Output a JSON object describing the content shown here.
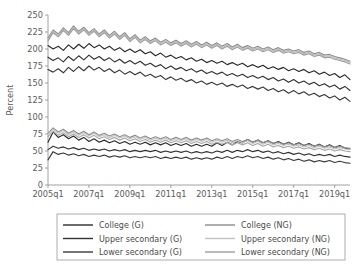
{
  "chart_data": {
    "type": "line",
    "title": "",
    "xlabel": "",
    "ylabel": "Percent",
    "ylim": [
      0,
      250
    ],
    "yticks": [
      0,
      25,
      50,
      75,
      100,
      125,
      150,
      175,
      200,
      225,
      250
    ],
    "ytick_labels": [
      "0",
      "25",
      "50",
      "75",
      "100",
      "125",
      "150",
      "175",
      "200",
      "225",
      "250"
    ],
    "xtick_labels": [
      "2005q1",
      "2007q1",
      "2009q1",
      "2011q1",
      "2013q1",
      "2015q1",
      "2017q1",
      "2019q1"
    ],
    "xtick_values": [
      2005.0,
      2007.0,
      2009.0,
      2011.0,
      2013.0,
      2015.0,
      2017.0,
      2019.0
    ],
    "xlim": [
      2005.0,
      2019.75
    ],
    "grid": false,
    "legend_position": "bottom",
    "x": [
      2005.0,
      2005.25,
      2005.5,
      2005.75,
      2006.0,
      2006.25,
      2006.5,
      2006.75,
      2007.0,
      2007.25,
      2007.5,
      2007.75,
      2008.0,
      2008.25,
      2008.5,
      2008.75,
      2009.0,
      2009.25,
      2009.5,
      2009.75,
      2010.0,
      2010.25,
      2010.5,
      2010.75,
      2011.0,
      2011.25,
      2011.5,
      2011.75,
      2012.0,
      2012.25,
      2012.5,
      2012.75,
      2013.0,
      2013.25,
      2013.5,
      2013.75,
      2014.0,
      2014.25,
      2014.5,
      2014.75,
      2015.0,
      2015.25,
      2015.5,
      2015.75,
      2016.0,
      2016.25,
      2016.5,
      2016.75,
      2017.0,
      2017.25,
      2017.5,
      2017.75,
      2018.0,
      2018.25,
      2018.5,
      2018.75,
      2019.0,
      2019.25,
      2019.5,
      2019.75
    ],
    "series": [
      {
        "name": "College (G)",
        "group": "G",
        "color": "#2b2b2b",
        "width": 1.15,
        "values": [
          205,
          200,
          204,
          198,
          206,
          200,
          207,
          201,
          208,
          202,
          206,
          200,
          204,
          198,
          202,
          196,
          200,
          195,
          199,
          193,
          196,
          190,
          194,
          188,
          191,
          186,
          189,
          184,
          187,
          182,
          185,
          180,
          183,
          179,
          182,
          177,
          180,
          176,
          179,
          174,
          177,
          173,
          176,
          171,
          174,
          170,
          173,
          168,
          171,
          167,
          170,
          165,
          168,
          163,
          166,
          161,
          164,
          158,
          162,
          155
        ]
      },
      {
        "name": "Upper secondary (G)",
        "group": "G",
        "color": "#333333",
        "width": 1.15,
        "values": [
          188,
          183,
          187,
          181,
          189,
          183,
          190,
          184,
          191,
          185,
          189,
          183,
          187,
          181,
          185,
          179,
          183,
          178,
          182,
          176,
          179,
          174,
          177,
          171,
          175,
          170,
          173,
          168,
          171,
          166,
          169,
          164,
          167,
          163,
          166,
          161,
          164,
          160,
          163,
          158,
          161,
          157,
          160,
          155,
          158,
          153,
          156,
          151,
          155,
          150,
          153,
          148,
          151,
          146,
          149,
          144,
          147,
          141,
          145,
          139
        ]
      },
      {
        "name": "Lower secondary (G)",
        "group": "G",
        "color": "#3a3a3a",
        "width": 1.15,
        "values": [
          170,
          166,
          171,
          165,
          173,
          167,
          174,
          168,
          175,
          169,
          173,
          167,
          171,
          165,
          169,
          163,
          167,
          162,
          166,
          160,
          163,
          158,
          161,
          155,
          159,
          154,
          157,
          152,
          155,
          150,
          153,
          148,
          151,
          147,
          150,
          145,
          148,
          144,
          147,
          142,
          145,
          141,
          144,
          139,
          142,
          137,
          140,
          135,
          139,
          134,
          137,
          132,
          135,
          130,
          133,
          128,
          131,
          125,
          129,
          123
        ]
      },
      {
        "name": "College (NG)",
        "group": "NG",
        "color": "#8c8c8c",
        "width": 1.15,
        "values": [
          216,
          228,
          222,
          231,
          224,
          234,
          226,
          232,
          224,
          230,
          222,
          228,
          220,
          226,
          218,
          224,
          215,
          221,
          213,
          218,
          212,
          216,
          210,
          214,
          209,
          213,
          208,
          212,
          207,
          211,
          206,
          210,
          205,
          209,
          204,
          208,
          203,
          207,
          202,
          205,
          201,
          204,
          200,
          203,
          199,
          202,
          198,
          200,
          197,
          199,
          195,
          197,
          193,
          195,
          191,
          192,
          189,
          187,
          185,
          182
        ]
      },
      {
        "name": "Upper secondary (NG)",
        "group": "NG",
        "color": "#b8b8b8",
        "width": 1.15,
        "values": [
          214,
          226,
          220,
          229,
          222,
          232,
          224,
          230,
          222,
          228,
          220,
          226,
          218,
          224,
          216,
          222,
          213,
          219,
          211,
          216,
          210,
          214,
          208,
          212,
          207,
          211,
          206,
          210,
          205,
          209,
          204,
          208,
          203,
          207,
          202,
          206,
          201,
          205,
          200,
          203,
          199,
          202,
          198,
          201,
          197,
          200,
          196,
          198,
          195,
          197,
          193,
          195,
          191,
          193,
          189,
          190,
          187,
          185,
          183,
          180
        ]
      },
      {
        "name": "Lower secondary (NG)",
        "group": "NG",
        "color": "#9e9e9e",
        "width": 1.15,
        "values": [
          212,
          224,
          218,
          227,
          220,
          230,
          222,
          228,
          220,
          226,
          218,
          224,
          216,
          222,
          214,
          220,
          211,
          217,
          209,
          214,
          208,
          212,
          206,
          210,
          205,
          209,
          204,
          208,
          203,
          207,
          202,
          206,
          201,
          205,
          200,
          204,
          199,
          203,
          198,
          201,
          197,
          200,
          196,
          199,
          195,
          198,
          194,
          196,
          193,
          195,
          191,
          193,
          189,
          191,
          187,
          188,
          185,
          183,
          181,
          178
        ]
      },
      {
        "name": "College (G) low",
        "group": "G",
        "color": "#2b2b2b",
        "width": 1.15,
        "values": [
          63,
          78,
          70,
          74,
          68,
          72,
          66,
          70,
          64,
          68,
          63,
          66,
          62,
          65,
          61,
          64,
          60,
          63,
          60,
          63,
          59,
          62,
          59,
          62,
          58,
          61,
          58,
          61,
          57,
          60,
          57,
          60,
          57,
          62,
          58,
          63,
          59,
          64,
          62,
          67,
          63,
          66,
          62,
          65,
          61,
          64,
          60,
          63,
          59,
          62,
          58,
          61,
          57,
          60,
          56,
          59,
          55,
          58,
          54,
          53
        ]
      },
      {
        "name": "Upper secondary (G) low",
        "group": "G",
        "color": "#333333",
        "width": 1.15,
        "values": [
          52,
          57,
          54,
          56,
          53,
          55,
          52,
          54,
          51,
          53,
          51,
          53,
          50,
          52,
          50,
          52,
          49,
          51,
          49,
          51,
          49,
          51,
          48,
          50,
          48,
          50,
          48,
          50,
          47,
          49,
          47,
          49,
          47,
          50,
          48,
          51,
          48,
          51,
          49,
          52,
          49,
          51,
          48,
          50,
          47,
          49,
          46,
          48,
          45,
          47,
          44,
          46,
          43,
          45,
          43,
          45,
          42,
          44,
          42,
          41
        ]
      },
      {
        "name": "Lower secondary (G) low",
        "group": "G",
        "color": "#3a3a3a",
        "width": 1.15,
        "values": [
          37,
          49,
          45,
          47,
          44,
          46,
          43,
          45,
          42,
          44,
          42,
          44,
          41,
          43,
          41,
          43,
          40,
          42,
          40,
          42,
          40,
          42,
          39,
          41,
          39,
          41,
          39,
          41,
          38,
          40,
          38,
          40,
          38,
          41,
          39,
          42,
          39,
          42,
          40,
          43,
          40,
          42,
          39,
          41,
          38,
          40,
          37,
          39,
          36,
          38,
          35,
          37,
          34,
          36,
          34,
          36,
          33,
          35,
          33,
          32
        ]
      },
      {
        "name": "College (NG) low",
        "group": "NG",
        "color": "#8c8c8c",
        "width": 1.15,
        "values": [
          76,
          84,
          78,
          82,
          76,
          80,
          75,
          79,
          74,
          78,
          73,
          76,
          72,
          75,
          71,
          74,
          70,
          73,
          69,
          72,
          68,
          71,
          68,
          71,
          67,
          70,
          67,
          70,
          66,
          69,
          66,
          69,
          65,
          68,
          65,
          68,
          64,
          67,
          64,
          67,
          63,
          66,
          62,
          65,
          61,
          63,
          60,
          62,
          59,
          61,
          58,
          60,
          57,
          59,
          56,
          58,
          55,
          57,
          55,
          54
        ]
      },
      {
        "name": "Upper secondary (NG) low",
        "group": "NG",
        "color": "#c2c2c2",
        "width": 1.15,
        "values": [
          74,
          82,
          76,
          80,
          74,
          78,
          73,
          77,
          72,
          76,
          71,
          74,
          70,
          73,
          69,
          72,
          68,
          71,
          67,
          70,
          66,
          69,
          66,
          69,
          65,
          68,
          65,
          68,
          64,
          67,
          64,
          67,
          63,
          66,
          63,
          66,
          62,
          65,
          62,
          65,
          61,
          64,
          60,
          63,
          59,
          61,
          58,
          60,
          57,
          59,
          56,
          58,
          55,
          57,
          54,
          56,
          53,
          55,
          53,
          52
        ]
      },
      {
        "name": "Lower secondary (NG) low",
        "group": "NG",
        "color": "#a8a8a8",
        "width": 1.15,
        "values": [
          71,
          79,
          73,
          77,
          71,
          75,
          70,
          74,
          69,
          73,
          68,
          71,
          67,
          70,
          66,
          69,
          65,
          68,
          64,
          67,
          63,
          66,
          63,
          66,
          62,
          65,
          62,
          65,
          61,
          64,
          61,
          64,
          60,
          63,
          60,
          63,
          59,
          62,
          59,
          62,
          58,
          61,
          57,
          60,
          56,
          58,
          55,
          57,
          54,
          56,
          53,
          55,
          52,
          54,
          51,
          53,
          50,
          52,
          50,
          49
        ]
      }
    ],
    "legend_entries": [
      {
        "label": "College (G)",
        "color": "#2b2b2b"
      },
      {
        "label": "Upper secondary (G)",
        "color": "#333333"
      },
      {
        "label": "Lower secondary (G)",
        "color": "#3a3a3a"
      },
      {
        "label": "College (NG)",
        "color": "#8c8c8c"
      },
      {
        "label": "Upper secondary (NG)",
        "color": "#c2c2c2"
      },
      {
        "label": "Lower secondary (NG)",
        "color": "#9e9e9e"
      }
    ]
  }
}
